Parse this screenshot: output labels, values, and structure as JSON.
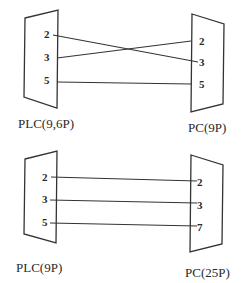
{
  "diagrams": [
    {
      "id": "top",
      "left_connector": {
        "label": "PLC(9,6P)",
        "pins": [
          "2",
          "3",
          "5"
        ]
      },
      "right_connector": {
        "label": "PC(9P)",
        "pins": [
          "2",
          "3",
          "5"
        ]
      },
      "wires": [
        {
          "from": "2",
          "to": "3"
        },
        {
          "from": "3",
          "to": "2"
        },
        {
          "from": "5",
          "to": "5"
        }
      ]
    },
    {
      "id": "bottom",
      "left_connector": {
        "label": "PLC(9P)",
        "pins": [
          "2",
          "3",
          "5"
        ]
      },
      "right_connector": {
        "label": "PC(25P)",
        "pins": [
          "2",
          "3",
          "7"
        ]
      },
      "wires": [
        {
          "from": "2",
          "to": "2"
        },
        {
          "from": "3",
          "to": "3"
        },
        {
          "from": "5",
          "to": "7"
        }
      ]
    }
  ],
  "colors": {
    "line": "#333333",
    "text": "#2a2a2a",
    "background": "#ffffff"
  }
}
